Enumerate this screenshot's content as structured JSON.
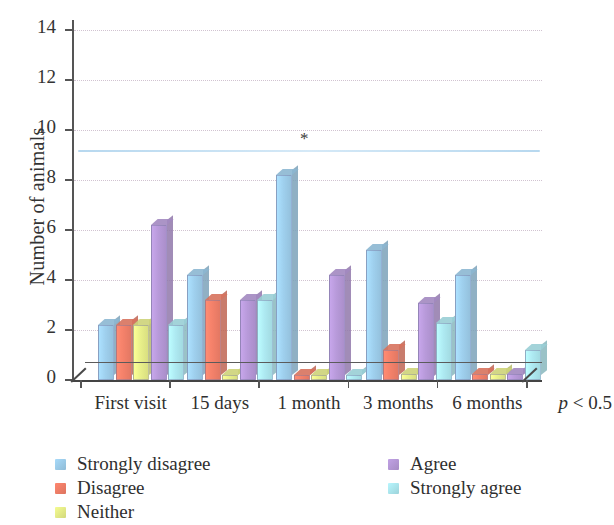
{
  "chart_data": {
    "type": "bar",
    "title": "",
    "xlabel": "",
    "ylabel": "Number of animals",
    "categories": [
      "First visit",
      "15 days",
      "1 month",
      "3 months",
      "6 months"
    ],
    "ylim": [
      0,
      14
    ],
    "yticks": [
      0,
      2,
      4,
      6,
      8,
      10,
      12,
      14
    ],
    "grid": true,
    "legend_position": "bottom",
    "series": [
      {
        "name": "Strongly disagree",
        "color": "#9fd0ee",
        "values": [
          2.2,
          4.2,
          8.2,
          5.2,
          4.2
        ]
      },
      {
        "name": "Disagree",
        "color": "#f4816a",
        "values": [
          2.2,
          3.2,
          0.2,
          1.2,
          0.25
        ]
      },
      {
        "name": "Neither",
        "color": "#e9f08a",
        "values": [
          2.2,
          0.2,
          0.2,
          0.25,
          0.25
        ]
      },
      {
        "name": "Agree",
        "color": "#b89ada",
        "values": [
          6.2,
          3.2,
          4.2,
          3.1,
          0.25
        ]
      },
      {
        "name": "Strongly agree",
        "color": "#aeeaf2",
        "values": [
          2.2,
          3.2,
          0.2,
          2.3,
          1.2
        ]
      }
    ],
    "annotations": [
      {
        "type": "significance-line",
        "label": "*",
        "y": 9.2,
        "x_start": "First visit",
        "x_end": "6 months",
        "color": "#b7d8ef"
      }
    ],
    "footnote": "p < 0.5"
  },
  "axis": {
    "y_title": "Number of animals",
    "y_tick_labels": [
      "0",
      "2",
      "4",
      "6",
      "8",
      "10",
      "12",
      "14"
    ],
    "x_tick_labels": [
      "First visit",
      "15 days",
      "1 month",
      "3 months",
      "6 months"
    ]
  },
  "significance": {
    "star": "*",
    "p_text_italic": "p",
    "p_text_rest": " < 0.5"
  },
  "legend": {
    "column_1": [
      {
        "label": "Strongly disagree",
        "color": "#9fd0ee"
      },
      {
        "label": "Disagree",
        "color": "#f4816a"
      },
      {
        "label": "Neither",
        "color": "#e9f08a"
      }
    ],
    "column_2": [
      {
        "label": "Agree",
        "color": "#b89ada"
      },
      {
        "label": "Strongly agree",
        "color": "#aeeaf2"
      }
    ]
  }
}
